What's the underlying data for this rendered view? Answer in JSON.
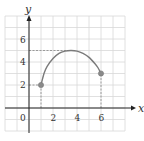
{
  "chart_data": {
    "type": "line",
    "title": "",
    "xlabel": "x",
    "ylabel": "y",
    "xlim": [
      -2,
      8
    ],
    "ylim": [
      -2,
      8
    ],
    "grid": true,
    "x_ticks": [
      0,
      2,
      4,
      6
    ],
    "y_ticks": [
      2,
      4,
      6
    ],
    "x_tick_labels": [
      "0",
      "2",
      "4",
      "6"
    ],
    "y_tick_labels": [
      "2",
      "4",
      "6"
    ],
    "series": [
      {
        "name": "f(x)",
        "x": [
          1,
          1.25,
          1.5,
          2,
          2.5,
          3,
          3.5,
          4,
          4.5,
          5,
          5.5,
          5.75,
          6
        ],
        "y": [
          2,
          3.0,
          3.6,
          4.3,
          4.75,
          4.95,
          5.0,
          4.95,
          4.75,
          4.4,
          3.85,
          3.5,
          3
        ]
      }
    ],
    "endpoints": [
      {
        "x": 1,
        "y": 2,
        "closed": true
      },
      {
        "x": 6,
        "y": 3,
        "closed": true
      }
    ],
    "dashed_guides": [
      {
        "from": [
          1,
          0
        ],
        "to": [
          1,
          2
        ]
      },
      {
        "from": [
          6,
          0
        ],
        "to": [
          6,
          3
        ]
      },
      {
        "from": [
          0,
          2
        ],
        "to": [
          1,
          2
        ]
      },
      {
        "from": [
          0,
          5
        ],
        "to": [
          3.5,
          5
        ]
      }
    ],
    "annotations": [],
    "colors": {
      "curve": "#7a7a7a",
      "point": "#8a8a8a",
      "grid": "#d8d8d8",
      "axis": "#222222"
    }
  },
  "labels": {
    "x_axis": "x",
    "y_axis": "y",
    "origin": "0",
    "x_ticks": [
      "2",
      "4",
      "6"
    ],
    "y_ticks": [
      "2",
      "4",
      "6"
    ]
  }
}
